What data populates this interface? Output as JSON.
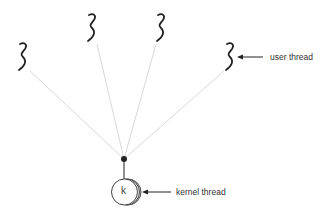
{
  "diagram": {
    "type": "many-to-one threading model",
    "user_threads_count": 4,
    "labels": {
      "user_thread": "user thread",
      "kernel_thread": "kernel thread",
      "kernel_symbol": "k"
    },
    "colors": {
      "thread_stroke": "#222222",
      "connector_line": "#d8d8d8",
      "arrow": "#222222",
      "text": "#333333"
    }
  }
}
